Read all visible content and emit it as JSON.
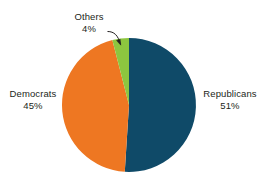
{
  "chart_data": {
    "type": "pie",
    "title": "",
    "subtitle": "",
    "xlabel": "",
    "ylabel": "",
    "legend_position": "none",
    "grid": false,
    "labels_inline": true,
    "unit": "%",
    "categories": [
      "Republicans",
      "Democrats",
      "Others"
    ],
    "values": [
      51,
      45,
      4
    ],
    "slices": [
      {
        "name": "Republicans",
        "value": 51,
        "value_label": "51%",
        "color": "#0f4a68",
        "start_angle_deg": 0,
        "end_angle_deg": 183.6,
        "label_position": "right",
        "leader_line": false
      },
      {
        "name": "Democrats",
        "value": 45,
        "value_label": "45%",
        "color": "#ee7722",
        "start_angle_deg": 183.6,
        "end_angle_deg": 345.6,
        "label_position": "left",
        "leader_line": false
      },
      {
        "name": "Others",
        "value": 4,
        "value_label": "4%",
        "color": "#8dc63f",
        "start_angle_deg": 345.6,
        "end_angle_deg": 360,
        "label_position": "top-left",
        "leader_line": true
      }
    ],
    "colors": {
      "republicans": "#0f4a68",
      "democrats": "#ee7722",
      "others": "#8dc63f",
      "text": "#231f20",
      "background": "#ffffff",
      "leader_line": "#231f20"
    },
    "geometry": {
      "center_x": 129,
      "center_y": 105,
      "radius": 67,
      "start_at_12_oclock": true,
      "direction": "clockwise"
    }
  }
}
